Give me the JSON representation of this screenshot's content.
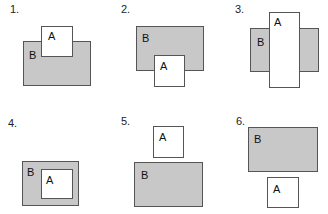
{
  "colors": {
    "b_fill": "#c8c8c8",
    "a_fill": "#ffffff",
    "stroke": "#555555"
  },
  "panels": [
    {
      "number": "1.",
      "a_label": "A",
      "b_label": "B",
      "relation": "A overlaps top edge of B"
    },
    {
      "number": "2.",
      "a_label": "A",
      "b_label": "B",
      "relation": "A overlaps bottom edge of B"
    },
    {
      "number": "3.",
      "a_label": "A",
      "b_label": "B",
      "relation": "A crosses through B vertically"
    },
    {
      "number": "4.",
      "a_label": "A",
      "b_label": "B",
      "relation": "A inside B"
    },
    {
      "number": "5.",
      "a_label": "A",
      "b_label": "B",
      "relation": "A above B, disjoint"
    },
    {
      "number": "6.",
      "a_label": "A",
      "b_label": "B",
      "relation": "A below B, disjoint"
    }
  ]
}
